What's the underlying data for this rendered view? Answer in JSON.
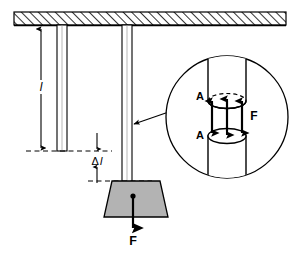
{
  "figure": {
    "type": "physics-diagram"
  },
  "labels": {
    "length": "l",
    "elongation_delta": "Δ",
    "elongation_l": "l",
    "force_main": "F",
    "force_inset": "F",
    "area_top": "A",
    "area_bottom": "A"
  },
  "colors": {
    "stroke": "#000000",
    "block_fill": "#b3b3b3",
    "hatch": "#000000",
    "rod_fill": "#ffffff",
    "background": "#ffffff"
  },
  "elements": {
    "ceiling": "hatched-support-ceiling",
    "reference_rod": "unloaded-reference-rod",
    "loaded_rod": "loaded-rod",
    "weight_block": "suspended-weight-block",
    "dimension_length": "length-dimension-line",
    "dimension_elongation": "elongation-dimension-line",
    "baseline_dashed": "original-length-dashed-line",
    "stretched_dashed": "stretched-length-dashed-line",
    "leader": "callout-leader-line",
    "inset_circle": "magnified-detail-circle",
    "inset_cylinder": "cut-cylinder-cross-section",
    "inset_arrows": "internal-tensile-force-arrows"
  }
}
